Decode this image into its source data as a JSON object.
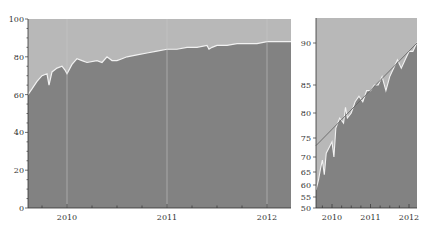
{
  "colors": {
    "background": "#ffffff",
    "upper_area": "#b8b8b8",
    "lower_area": "#828282",
    "line": "#f2f2f2",
    "trend_line": "#666666",
    "gridline": "#c9c9c9",
    "axis": "#333333"
  },
  "chart_data": [
    {
      "type": "area",
      "title": "",
      "xlabel": "",
      "ylabel": "",
      "ylim": [
        0,
        100
      ],
      "yticks": [
        0,
        20,
        40,
        60,
        80,
        100
      ],
      "xticks": [
        "2010",
        "2011",
        "2012"
      ],
      "grid": "vertical lines at year boundaries",
      "x": [
        2009.6,
        2009.65,
        2009.7,
        2009.75,
        2009.8,
        2009.82,
        2009.85,
        2009.9,
        2009.95,
        2009.98,
        2010.0,
        2010.05,
        2010.1,
        2010.15,
        2010.2,
        2010.3,
        2010.35,
        2010.4,
        2010.45,
        2010.5,
        2010.55,
        2010.6,
        2010.7,
        2010.8,
        2010.9,
        2011.0,
        2011.1,
        2011.2,
        2011.3,
        2011.4,
        2011.42,
        2011.45,
        2011.5,
        2011.6,
        2011.7,
        2011.8,
        2011.9,
        2012.0,
        2012.1,
        2012.2,
        2012.24
      ],
      "values": [
        60,
        63,
        67,
        70,
        71,
        65,
        72,
        74,
        75,
        73,
        71,
        76,
        79,
        78,
        77,
        78,
        77,
        80,
        78,
        78,
        79,
        80,
        81,
        82,
        83,
        84,
        84,
        85,
        85,
        86,
        84,
        85,
        86,
        86,
        87,
        87,
        87,
        88,
        88,
        88,
        88
      ],
      "series": [
        {
          "name": "lower (dark)",
          "description": "Area from 0 up to the value line"
        },
        {
          "name": "upper (light)",
          "description": "Area from the value line up to 100"
        }
      ]
    },
    {
      "type": "area",
      "title": "",
      "xlabel": "",
      "ylabel": "",
      "ylim": [
        50,
        93
      ],
      "yscale": "logit-like (nonlinear)",
      "yticks": [
        50,
        55,
        60,
        65,
        70,
        75,
        80,
        85,
        90
      ],
      "xticks": [
        "2010",
        "2011",
        "2012"
      ],
      "x": [
        2009.6,
        2009.65,
        2009.7,
        2009.75,
        2009.8,
        2009.85,
        2009.9,
        2010.0,
        2010.05,
        2010.1,
        2010.2,
        2010.3,
        2010.35,
        2010.4,
        2010.5,
        2010.6,
        2010.7,
        2010.8,
        2010.9,
        2011.0,
        2011.1,
        2011.2,
        2011.3,
        2011.4,
        2011.5,
        2011.6,
        2011.7,
        2011.8,
        2011.9,
        2012.0,
        2012.1,
        2012.2,
        2012.24
      ],
      "values": [
        58,
        62,
        66,
        69,
        64,
        71,
        72,
        74,
        70,
        77,
        79,
        78,
        81,
        79,
        80,
        82,
        83,
        82,
        84,
        84,
        85,
        85,
        86,
        84,
        86,
        87,
        88,
        87,
        88,
        89,
        89,
        90,
        90
      ],
      "trend_line": {
        "start": [
          2009.6,
          73
        ],
        "end": [
          2012.24,
          90
        ]
      }
    }
  ]
}
